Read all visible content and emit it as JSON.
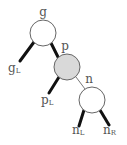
{
  "diagram": {
    "type": "binary-tree",
    "colors": {
      "background": "#ffffff",
      "node_stroke": "#666666",
      "node_fill": "#ffffff",
      "highlight_fill": "#d9d9d9",
      "thick_edge": "#111111",
      "thin_edge": "#777777",
      "label": "#555555"
    },
    "nodes": [
      {
        "id": "g",
        "label": "g",
        "highlighted": false,
        "cx": 43,
        "cy": 33,
        "r": 13
      },
      {
        "id": "p",
        "label": "p",
        "highlighted": true,
        "cx": 67,
        "cy": 67,
        "r": 13
      },
      {
        "id": "n",
        "label": "n",
        "highlighted": false,
        "cx": 92,
        "cy": 100,
        "r": 13
      }
    ],
    "subtrees": [
      {
        "id": "gL",
        "base": "g",
        "sub": "L"
      },
      {
        "id": "pL",
        "base": "p",
        "sub": "L"
      },
      {
        "id": "nL",
        "base": "n",
        "sub": "L"
      },
      {
        "id": "nR",
        "base": "n",
        "sub": "R"
      }
    ],
    "edges": [
      {
        "from": "g",
        "to": "gL",
        "style": "thick"
      },
      {
        "from": "g",
        "to": "p",
        "style": "thick"
      },
      {
        "from": "p",
        "to": "pL",
        "style": "thick"
      },
      {
        "from": "p",
        "to": "n",
        "style": "thin"
      },
      {
        "from": "n",
        "to": "nL",
        "style": "thick"
      },
      {
        "from": "n",
        "to": "nR",
        "style": "thick"
      }
    ]
  }
}
